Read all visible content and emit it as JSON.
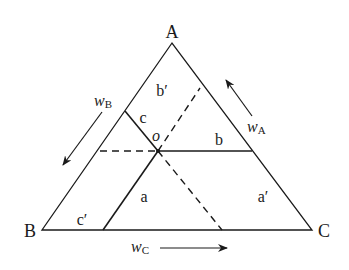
{
  "diagram": {
    "type": "ternary-phase-diagram",
    "vertices": {
      "A": "A",
      "B": "B",
      "C": "C"
    },
    "point": "o",
    "regions": {
      "b_prime": "b′",
      "c": "c",
      "b": "b",
      "a": "a",
      "a_prime": "a′",
      "c_prime": "c′"
    },
    "axes": {
      "wA": {
        "var": "w",
        "sub": "A"
      },
      "wB": {
        "var": "w",
        "sub": "B"
      },
      "wC": {
        "var": "w",
        "sub": "C"
      }
    },
    "colors": {
      "line": "#1a1a1a",
      "background": "#ffffff"
    }
  }
}
